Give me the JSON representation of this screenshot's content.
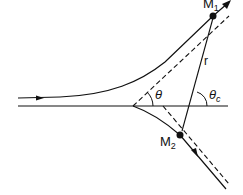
{
  "diagram": {
    "labels": {
      "m1": "M",
      "m1_sub": "1",
      "m2": "M",
      "m2_sub": "2",
      "r": "r",
      "theta": "θ",
      "theta_c": "θ",
      "theta_c_sub": "c"
    },
    "colors": {
      "stroke": "#111111",
      "background": "#ffffff"
    }
  }
}
